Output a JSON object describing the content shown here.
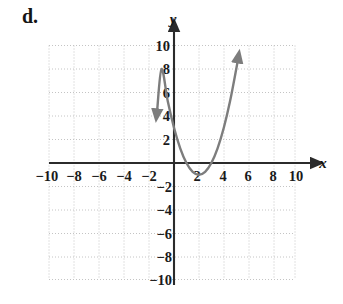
{
  "part_label": "d.",
  "chart_data": {
    "type": "line",
    "title": "",
    "subtitle": "",
    "xlabel": "x",
    "ylabel": "y",
    "xlim": [
      -11,
      11
    ],
    "ylim": [
      -11,
      11
    ],
    "grid": true,
    "grid_step": 2,
    "legend": "none",
    "x_ticks": [
      -10,
      -8,
      -6,
      -4,
      -2,
      2,
      4,
      6,
      8,
      10
    ],
    "x_tick_labels": [
      "−10",
      "−8",
      "−6",
      "−4",
      "−2",
      "2",
      "4",
      "6",
      "8",
      "10"
    ],
    "y_ticks": [
      10,
      8,
      6,
      4,
      2,
      -2,
      -4,
      -6,
      -8,
      -10
    ],
    "y_tick_labels": [
      "10",
      "8",
      "6",
      "4",
      "2",
      "−2",
      "−4",
      "−6",
      "−8",
      "−10"
    ],
    "curve": {
      "name": "parabola",
      "equation": "y = (x - 2)^2 - 1",
      "vertex": [
        2,
        -1
      ],
      "y_intercept": 3,
      "x_intercepts": [
        1,
        3
      ],
      "opens": "up",
      "color": "#7d7d7d",
      "arrow_ends": [
        "left",
        "right"
      ],
      "left_end": [
        -1.35,
        4.5
      ],
      "right_end": [
        5.1,
        9.6
      ],
      "points": [
        [
          -1.35,
          4.52
        ],
        [
          -1.0,
          8.0
        ],
        [
          -0.5,
          5.25
        ],
        [
          0.0,
          3.0
        ],
        [
          0.5,
          1.25
        ],
        [
          1.0,
          0.0
        ],
        [
          1.5,
          -0.75
        ],
        [
          2.0,
          -1.0
        ],
        [
          2.5,
          -0.75
        ],
        [
          3.0,
          0.0
        ],
        [
          3.5,
          1.25
        ],
        [
          4.0,
          3.0
        ],
        [
          4.5,
          5.25
        ],
        [
          5.0,
          8.0
        ],
        [
          5.1,
          8.61
        ]
      ]
    },
    "axis_color": "#2b2b2b",
    "grid_color": "#c9c9c9"
  }
}
